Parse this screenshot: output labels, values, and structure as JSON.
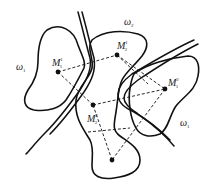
{
  "figure": {
    "regions": [
      {
        "id": "omega1-left",
        "label": "ω",
        "sub": "1"
      },
      {
        "id": "omega2",
        "label": "ω",
        "sub": "2"
      },
      {
        "id": "omega1-right",
        "label": "ω",
        "sub": "1"
      }
    ],
    "points": [
      {
        "id": "M11",
        "label": "M",
        "sub": "1",
        "sup": "1"
      },
      {
        "id": "M21",
        "label": "M",
        "sub": "2",
        "sup": "1"
      },
      {
        "id": "M12",
        "label": "M",
        "sub": "1",
        "sup": "2"
      },
      {
        "id": "M22",
        "label": "M",
        "sub": "2",
        "sup": "2"
      },
      {
        "id": "bottom",
        "label": "",
        "sub": "",
        "sup": ""
      }
    ],
    "colors": {
      "stroke": "#111111",
      "background": "#ffffff"
    }
  }
}
